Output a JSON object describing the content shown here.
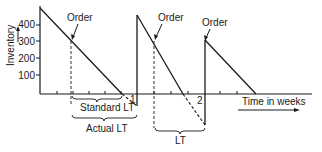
{
  "diagram": {
    "type": "inventory-sawtooth",
    "y_axis": {
      "label": "Inventory",
      "ticks": [
        "400",
        "300",
        "200",
        "100"
      ]
    },
    "x_axis": {
      "label": "Time in weeks",
      "ticks": [
        "1",
        "2"
      ]
    },
    "annotations": {
      "order_1": "Order",
      "order_2": "Order",
      "order_3": "Order",
      "standard_lt": "Standard LT",
      "actual_lt": "Actual LT",
      "lt": "LT"
    },
    "colors": {
      "line": "#1a1a1a",
      "background": "#ffffff"
    }
  }
}
